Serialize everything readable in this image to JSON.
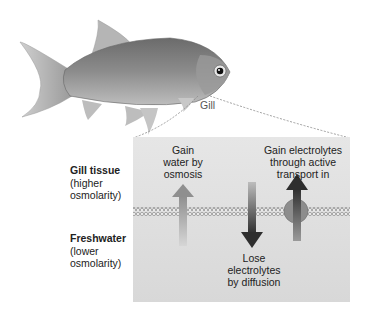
{
  "diagram": {
    "fish_label": "Gill",
    "side_labels": {
      "top": {
        "title": "Gill tissue",
        "subtitle_line1": "(higher",
        "subtitle_line2": "osmolarity)"
      },
      "bottom": {
        "title": "Freshwater",
        "subtitle_line1": "(lower",
        "subtitle_line2": "osmolarity)"
      }
    },
    "arrows": [
      {
        "id": "water",
        "direction": "up",
        "label_lines": [
          "Gain",
          "water by",
          "osmosis"
        ],
        "color": "#a8a8a8"
      },
      {
        "id": "diffusion",
        "direction": "down",
        "label_lines": [
          "Lose",
          "electrolytes",
          "by diffusion"
        ],
        "color": "#3a3a3a"
      },
      {
        "id": "active",
        "direction": "up",
        "label_lines": [
          "Gain electrolytes",
          "through active",
          "transport in"
        ],
        "color": "#3a3a3a"
      }
    ],
    "colors": {
      "panel_top": "#e4e4e4",
      "panel_bottom": "#d9d9d9",
      "membrane": "#8a8a8a",
      "protein": "#8d8d8d"
    }
  }
}
